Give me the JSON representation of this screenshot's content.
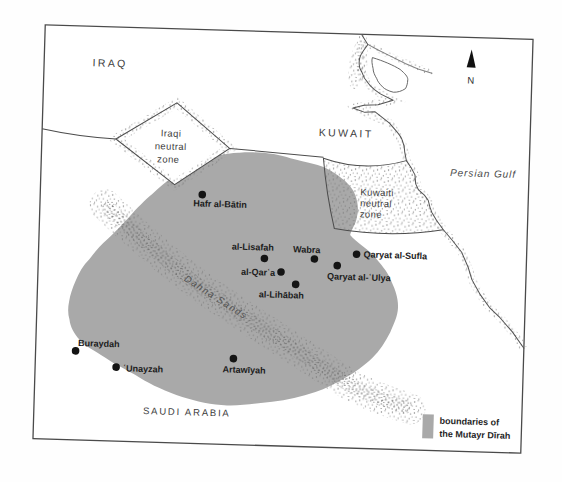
{
  "map": {
    "regions": {
      "iraq": "IRAQ",
      "kuwait": "KUWAIT",
      "saudi_arabia": "SAUDI ARABIA",
      "persian_gulf": "Persian Gulf"
    },
    "zones": {
      "iraqi_neutral": {
        "line1": "Iraqi",
        "line2": "neutral",
        "line3": "zone"
      },
      "kuwaiti_neutral": {
        "line1": "Kuwaiti",
        "line2": "neutral",
        "line3": "zone"
      }
    },
    "features": {
      "sands": "Dahna Sands"
    },
    "cities": [
      {
        "name": "Hafr al-Bātin"
      },
      {
        "name": "al-Lisafah"
      },
      {
        "name": "Wabra"
      },
      {
        "name": "Qaryat al-Sufla"
      },
      {
        "name": "al-Qarʿa"
      },
      {
        "name": "Qaryat al-ʿUlya"
      },
      {
        "name": "al-Lihābah"
      },
      {
        "name": "Buraydah"
      },
      {
        "name": "ʿUnayzah"
      },
      {
        "name": "Artawīyah"
      }
    ],
    "compass": {
      "label": "N"
    },
    "legend": {
      "line1": "boundaries of",
      "line2": "the Mutayr Dīrah"
    },
    "colors": {
      "dirah_fill": "#a9a9a9",
      "ink": "#2e2e2e",
      "stipple": "#6e6e6e"
    }
  }
}
